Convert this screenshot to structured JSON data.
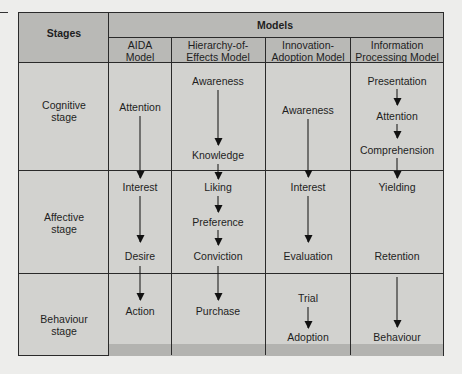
{
  "header": {
    "stages_label": "Stages",
    "models_label": "Models",
    "models": [
      {
        "line1": "AIDA",
        "line2": "Model"
      },
      {
        "line1": "Hierarchy-of-",
        "line2": "Effects Model"
      },
      {
        "line1": "Innovation-",
        "line2": "Adoption Model"
      },
      {
        "line1": "Information",
        "line2": "Processing Model"
      }
    ]
  },
  "stages": [
    {
      "line1": "Cognitive",
      "line2": "stage"
    },
    {
      "line1": "Affective",
      "line2": "stage"
    },
    {
      "line1": "Behaviour",
      "line2": "stage"
    }
  ],
  "aida": [
    "Attention",
    "Interest",
    "Desire",
    "Action"
  ],
  "hierarchy": [
    "Awareness",
    "Knowledge",
    "Liking",
    "Preference",
    "Conviction",
    "Purchase"
  ],
  "innovation": [
    "Awareness",
    "Interest",
    "Evaluation",
    "Trial",
    "Adoption"
  ],
  "information": [
    "Presentation",
    "Attention",
    "Comprehension",
    "Yielding",
    "Retention",
    "Behaviour"
  ]
}
